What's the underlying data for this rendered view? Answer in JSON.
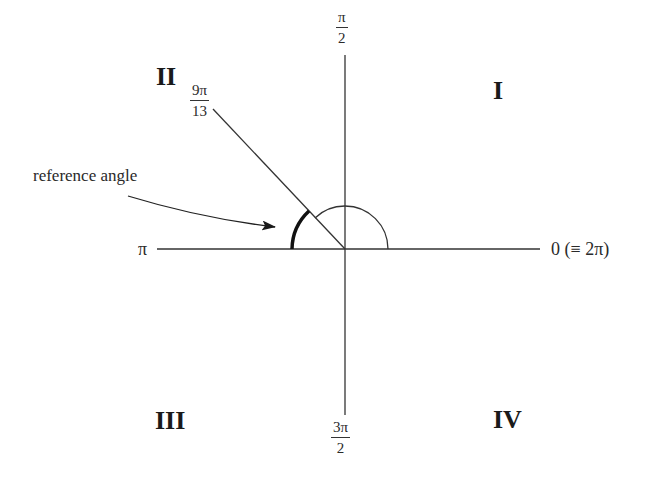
{
  "diagram": {
    "quadrants": {
      "q1": "I",
      "q2": "II",
      "q3": "III",
      "q4": "IV"
    },
    "axis_labels": {
      "right": "0 (≡ 2π)",
      "left": "π",
      "top": {
        "numerator": "π",
        "denominator": "2"
      },
      "bottom": {
        "numerator": "3π",
        "denominator": "2"
      }
    },
    "angle_label": {
      "numerator": "9π",
      "denominator": "13"
    },
    "annotation": "reference angle",
    "colors": {
      "line": "#333333",
      "text": "#222222",
      "background": "#ffffff"
    }
  }
}
